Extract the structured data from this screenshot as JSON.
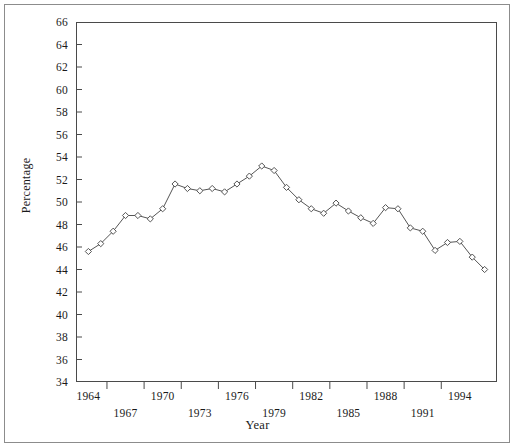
{
  "chart_data": {
    "type": "line",
    "title": "",
    "xlabel": "Year",
    "ylabel": "Percentage",
    "grid": false,
    "legend": null,
    "marker": "open-diamond",
    "line_color": "#555555",
    "marker_color": "#555555",
    "background": "#ffffff",
    "xlim": [
      1963.0,
      1997.0
    ],
    "ylim": [
      34,
      66
    ],
    "ytick_step": 2,
    "yticks": [
      34,
      36,
      38,
      40,
      42,
      44,
      46,
      48,
      50,
      52,
      54,
      56,
      58,
      60,
      62,
      64,
      66
    ],
    "ytick_labels": [
      "34",
      "36",
      "38",
      "40",
      "42",
      "44",
      "46",
      "48",
      "50",
      "52",
      "54",
      "56",
      "58",
      "60",
      "62",
      "64",
      "66"
    ],
    "xticks_upper": [
      1964,
      1970,
      1976,
      1982,
      1988,
      1994
    ],
    "xticks_lower": [
      1967,
      1973,
      1979,
      1985,
      1991
    ],
    "xtick_labels_upper": [
      "1964",
      "1970",
      "1976",
      "1982",
      "1988",
      "1994"
    ],
    "xtick_labels_lower": [
      "1967",
      "1973",
      "1979",
      "1985",
      "1991"
    ],
    "x": [
      1964,
      1965,
      1966,
      1967,
      1968,
      1969,
      1970,
      1971,
      1972,
      1973,
      1974,
      1975,
      1976,
      1977,
      1978,
      1979,
      1980,
      1981,
      1982,
      1983,
      1984,
      1985,
      1986,
      1987,
      1988,
      1989,
      1990,
      1991,
      1992,
      1993,
      1994,
      1995,
      1996
    ],
    "values": [
      45.6,
      46.3,
      47.4,
      48.8,
      48.8,
      48.5,
      49.4,
      51.6,
      51.2,
      51.0,
      51.2,
      50.9,
      51.6,
      52.3,
      53.2,
      52.8,
      51.3,
      50.2,
      49.4,
      49.0,
      49.9,
      49.2,
      48.6,
      48.1,
      49.5,
      49.4,
      47.7,
      47.4,
      45.7,
      46.4,
      46.5,
      45.1,
      44.0
    ]
  }
}
